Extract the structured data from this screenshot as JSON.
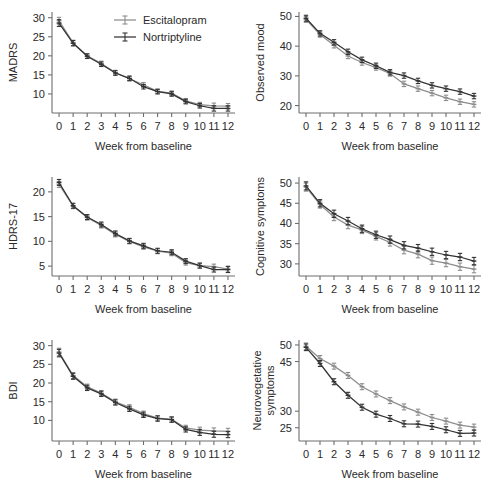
{
  "figure": {
    "name": "depression-rating-scales-over-time",
    "xlabel": "Week from baseline",
    "legend": {
      "position": "top-right-of-panel-1",
      "entries": [
        {
          "label": "Escitalopram",
          "color": "#8d8d8d"
        },
        {
          "label": "Nortriptyline",
          "color": "#333333"
        }
      ]
    }
  },
  "chart_data": [
    {
      "type": "line",
      "panel": "top-left",
      "title": "",
      "ylabel": "MADRS",
      "xlabel": "Week from baseline",
      "x": [
        0,
        1,
        2,
        3,
        4,
        5,
        6,
        7,
        8,
        9,
        10,
        11,
        12
      ],
      "xticks": [
        0,
        1,
        2,
        3,
        4,
        5,
        6,
        7,
        8,
        9,
        10,
        11,
        12
      ],
      "yticks": [
        10,
        15,
        20,
        25,
        30
      ],
      "xlim": [
        -0.5,
        12.5
      ],
      "ylim": [
        5.0,
        31.5
      ],
      "grid": false,
      "series": [
        {
          "name": "Escitalopram",
          "color": "#8d8d8d",
          "values": [
            29.2,
            23.4,
            20.0,
            18.0,
            15.6,
            14.0,
            12.4,
            10.7,
            10.2,
            8.2,
            7.2,
            6.9,
            6.8
          ],
          "err": [
            0.9,
            0.7,
            0.6,
            0.6,
            0.6,
            0.6,
            0.6,
            0.6,
            0.6,
            0.6,
            0.6,
            0.7,
            0.7
          ]
        },
        {
          "name": "Nortriptyline",
          "color": "#333333",
          "values": [
            28.6,
            23.3,
            19.9,
            17.8,
            15.5,
            14.1,
            11.9,
            10.6,
            10.0,
            8.0,
            6.9,
            6.2,
            6.2
          ],
          "err": [
            0.9,
            0.7,
            0.6,
            0.6,
            0.6,
            0.6,
            0.6,
            0.6,
            0.6,
            0.6,
            0.6,
            0.7,
            0.7
          ]
        }
      ]
    },
    {
      "type": "line",
      "panel": "top-right",
      "title": "",
      "ylabel": "Observed mood",
      "xlabel": "Week from baseline",
      "x": [
        0,
        1,
        2,
        3,
        4,
        5,
        6,
        7,
        8,
        9,
        10,
        11,
        12
      ],
      "xticks": [
        0,
        1,
        2,
        3,
        4,
        5,
        6,
        7,
        8,
        9,
        10,
        11,
        12
      ],
      "yticks": [
        20,
        30,
        40,
        50
      ],
      "xlim": [
        -0.5,
        12.5
      ],
      "ylim": [
        17.5,
        51.5
      ],
      "grid": false,
      "series": [
        {
          "name": "Escitalopram",
          "color": "#8d8d8d",
          "values": [
            49.0,
            43.9,
            40.3,
            36.7,
            34.5,
            32.8,
            30.8,
            27.3,
            25.7,
            24.2,
            22.6,
            21.3,
            20.4
          ],
          "err": [
            1.0,
            0.9,
            0.9,
            0.9,
            0.9,
            0.9,
            0.9,
            0.9,
            0.9,
            0.9,
            0.9,
            0.9,
            0.9
          ]
        },
        {
          "name": "Nortriptyline",
          "color": "#333333",
          "values": [
            49.4,
            44.3,
            41.3,
            38.1,
            35.4,
            33.4,
            31.2,
            30.1,
            28.3,
            26.8,
            25.7,
            24.7,
            23.2
          ],
          "err": [
            1.0,
            0.9,
            0.9,
            0.9,
            0.9,
            0.9,
            0.9,
            0.9,
            0.9,
            0.9,
            0.9,
            0.9,
            0.9
          ]
        }
      ]
    },
    {
      "type": "line",
      "panel": "middle-left",
      "title": "",
      "ylabel": "HDRS-17",
      "xlabel": "Week from baseline",
      "x": [
        0,
        1,
        2,
        3,
        4,
        5,
        6,
        7,
        8,
        9,
        10,
        11,
        12
      ],
      "xticks": [
        0,
        1,
        2,
        3,
        4,
        5,
        6,
        7,
        8,
        9,
        10,
        11,
        12
      ],
      "yticks": [
        5,
        10,
        15,
        20
      ],
      "xlim": [
        -0.5,
        12.5
      ],
      "ylim": [
        3.0,
        23.0
      ],
      "grid": false,
      "series": [
        {
          "name": "Escitalopram",
          "color": "#8d8d8d",
          "values": [
            21.5,
            17.1,
            14.8,
            13.2,
            11.4,
            10.0,
            8.9,
            8.0,
            7.6,
            5.7,
            5.1,
            4.9,
            4.4
          ],
          "err": [
            0.6,
            0.5,
            0.5,
            0.5,
            0.5,
            0.5,
            0.5,
            0.5,
            0.5,
            0.5,
            0.5,
            0.5,
            0.6
          ]
        },
        {
          "name": "Nortriptyline",
          "color": "#333333",
          "values": [
            21.9,
            17.2,
            14.9,
            13.4,
            11.6,
            10.1,
            9.1,
            8.1,
            7.8,
            6.0,
            5.1,
            4.3,
            4.3
          ],
          "err": [
            0.6,
            0.5,
            0.5,
            0.5,
            0.5,
            0.5,
            0.5,
            0.5,
            0.5,
            0.5,
            0.5,
            0.5,
            0.6
          ]
        }
      ]
    },
    {
      "type": "line",
      "panel": "middle-right",
      "title": "",
      "ylabel": "Cognitive symptoms",
      "xlabel": "Week from baseline",
      "x": [
        0,
        1,
        2,
        3,
        4,
        5,
        6,
        7,
        8,
        9,
        10,
        11,
        12
      ],
      "xticks": [
        0,
        1,
        2,
        3,
        4,
        5,
        6,
        7,
        8,
        9,
        10,
        11,
        12
      ],
      "yticks": [
        30,
        35,
        40,
        45,
        50
      ],
      "xlim": [
        -0.5,
        12.5
      ],
      "ylim": [
        27.0,
        51.5
      ],
      "grid": false,
      "series": [
        {
          "name": "Escitalopram",
          "color": "#8d8d8d",
          "values": [
            49.0,
            44.7,
            41.6,
            39.6,
            38.4,
            36.8,
            35.3,
            33.4,
            32.4,
            30.8,
            30.2,
            29.3,
            28.7
          ],
          "err": [
            1.0,
            0.9,
            0.9,
            0.9,
            0.9,
            0.9,
            0.9,
            0.9,
            0.9,
            0.9,
            0.9,
            0.9,
            0.9
          ]
        },
        {
          "name": "Nortriptyline",
          "color": "#333333",
          "values": [
            49.3,
            45.0,
            42.4,
            40.6,
            38.7,
            37.2,
            36.0,
            34.6,
            33.9,
            33.0,
            32.2,
            31.7,
            30.7
          ],
          "err": [
            1.0,
            0.9,
            0.9,
            0.9,
            0.9,
            0.9,
            0.9,
            0.9,
            0.9,
            0.9,
            0.9,
            0.9,
            0.9
          ]
        }
      ]
    },
    {
      "type": "line",
      "panel": "bottom-left",
      "title": "",
      "ylabel": "BDI",
      "xlabel": "Week from baseline",
      "x": [
        0,
        1,
        2,
        3,
        4,
        5,
        6,
        7,
        8,
        9,
        10,
        11,
        12
      ],
      "xticks": [
        0,
        1,
        2,
        3,
        4,
        5,
        6,
        7,
        8,
        9,
        10,
        11,
        12
      ],
      "yticks": [
        10,
        15,
        20,
        25,
        30
      ],
      "xlim": [
        -0.5,
        12.5
      ],
      "ylim": [
        4.5,
        31.5
      ],
      "grid": false,
      "series": [
        {
          "name": "Escitalopram",
          "color": "#8d8d8d",
          "values": [
            28.3,
            22.0,
            19.0,
            17.3,
            15.0,
            13.5,
            11.8,
            10.6,
            10.3,
            8.0,
            7.4,
            7.2,
            7.1
          ],
          "err": [
            1.0,
            0.8,
            0.7,
            0.7,
            0.7,
            0.7,
            0.7,
            0.7,
            0.7,
            0.7,
            0.8,
            0.8,
            0.8
          ]
        },
        {
          "name": "Nortriptyline",
          "color": "#333333",
          "values": [
            28.0,
            21.8,
            18.7,
            17.1,
            14.8,
            13.1,
            11.5,
            10.5,
            10.2,
            7.6,
            6.8,
            6.3,
            6.2
          ],
          "err": [
            1.0,
            0.8,
            0.7,
            0.7,
            0.7,
            0.7,
            0.7,
            0.7,
            0.7,
            0.7,
            0.8,
            0.8,
            0.8
          ]
        }
      ]
    },
    {
      "type": "line",
      "panel": "bottom-right",
      "title": "",
      "ylabel": "Neurovegetative symptoms",
      "ylabel_line1": "Neurovegetative",
      "ylabel_line2": "symptoms",
      "xlabel": "Week from baseline",
      "x": [
        0,
        1,
        2,
        3,
        4,
        5,
        6,
        7,
        8,
        9,
        10,
        11,
        12
      ],
      "xticks": [
        0,
        1,
        2,
        3,
        4,
        5,
        6,
        7,
        8,
        9,
        10,
        11,
        12
      ],
      "yticks": [
        25,
        30,
        45,
        50
      ],
      "xlim": [
        -0.5,
        12.5
      ],
      "ylim": [
        21.0,
        51.5
      ],
      "grid": false,
      "series": [
        {
          "name": "Escitalopram",
          "color": "#8d8d8d",
          "values": [
            49.6,
            45.9,
            43.6,
            40.8,
            37.4,
            35.2,
            33.2,
            31.3,
            29.7,
            28.1,
            27.0,
            25.8,
            25.2
          ],
          "err": [
            1.0,
            0.9,
            0.9,
            0.9,
            0.9,
            0.9,
            0.9,
            0.9,
            0.9,
            0.9,
            0.9,
            0.9,
            0.9
          ]
        },
        {
          "name": "Nortriptyline",
          "color": "#333333",
          "values": [
            49.3,
            44.4,
            38.9,
            34.8,
            31.2,
            29.1,
            27.8,
            26.2,
            26.1,
            25.4,
            24.4,
            23.3,
            23.4
          ],
          "err": [
            1.0,
            0.9,
            0.9,
            0.9,
            0.9,
            0.9,
            0.9,
            0.9,
            0.9,
            0.9,
            0.9,
            0.9,
            0.9
          ]
        }
      ]
    }
  ]
}
